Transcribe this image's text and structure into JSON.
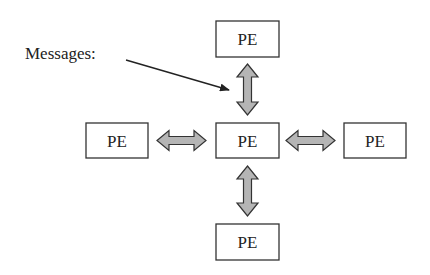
{
  "diagram": {
    "type": "mesh-neighbor-communication",
    "annotation": {
      "label": "Messages:",
      "points_to": "north-link"
    },
    "nodes": [
      {
        "id": "north",
        "label": "PE"
      },
      {
        "id": "west",
        "label": "PE"
      },
      {
        "id": "center",
        "label": "PE"
      },
      {
        "id": "east",
        "label": "PE"
      },
      {
        "id": "south",
        "label": "PE"
      }
    ],
    "links": [
      {
        "from": "center",
        "to": "north",
        "direction": "bidirectional"
      },
      {
        "from": "center",
        "to": "west",
        "direction": "bidirectional"
      },
      {
        "from": "center",
        "to": "east",
        "direction": "bidirectional"
      },
      {
        "from": "center",
        "to": "south",
        "direction": "bidirectional"
      }
    ],
    "colors": {
      "arrow_fill": "#b5b5b5",
      "stroke": "#333333",
      "background": "#ffffff"
    }
  }
}
